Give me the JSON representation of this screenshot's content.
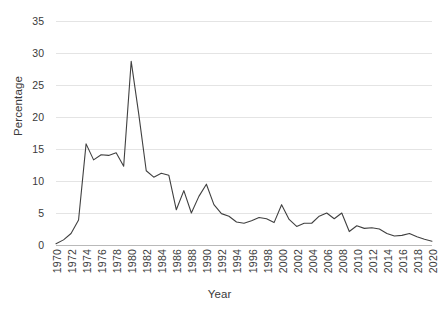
{
  "chart_data": {
    "type": "line",
    "title": "",
    "xlabel": "Year",
    "ylabel": "Percentage",
    "xlim": [
      1970,
      2020
    ],
    "ylim": [
      0,
      35
    ],
    "yticks": [
      0,
      5,
      10,
      15,
      20,
      25,
      30,
      35
    ],
    "xticks": [
      "1970",
      "1972",
      "1974",
      "1976",
      "1978",
      "1980",
      "1982",
      "1984",
      "1986",
      "1988",
      "1990",
      "1992",
      "1994",
      "1996",
      "1998",
      "2000",
      "2002",
      "2004",
      "2006",
      "2008",
      "2010",
      "2012",
      "2014",
      "2016",
      "2018",
      "2020"
    ],
    "grid": true,
    "legend": "none",
    "line_color": "#404040",
    "grid_color": "#e4e4e4",
    "axis_color": "#b9b9b9",
    "x": [
      1970,
      1971,
      1972,
      1973,
      1974,
      1975,
      1976,
      1977,
      1978,
      1979,
      1980,
      1981,
      1982,
      1983,
      1984,
      1985,
      1986,
      1987,
      1988,
      1989,
      1990,
      1991,
      1992,
      1993,
      1994,
      1995,
      1996,
      1997,
      1998,
      1999,
      2000,
      2001,
      2002,
      2003,
      2004,
      2005,
      2006,
      2007,
      2008,
      2009,
      2010,
      2011,
      2012,
      2013,
      2014,
      2015,
      2016,
      2017,
      2018,
      2019,
      2020
    ],
    "values": [
      0.2,
      0.8,
      1.8,
      3.9,
      15.8,
      13.3,
      14.1,
      14.0,
      14.4,
      12.3,
      28.7,
      20.5,
      11.6,
      10.6,
      11.2,
      10.9,
      5.5,
      8.5,
      5.0,
      7.6,
      9.5,
      6.3,
      4.9,
      4.5,
      3.6,
      3.4,
      3.8,
      4.3,
      4.1,
      3.5,
      6.3,
      4.0,
      2.9,
      3.4,
      3.4,
      4.5,
      5.0,
      4.1,
      5.0,
      2.1,
      3.0,
      2.6,
      2.7,
      2.5,
      1.8,
      1.4,
      1.5,
      1.8,
      1.3,
      0.9,
      0.6
    ],
    "series_name": "Percentage"
  }
}
